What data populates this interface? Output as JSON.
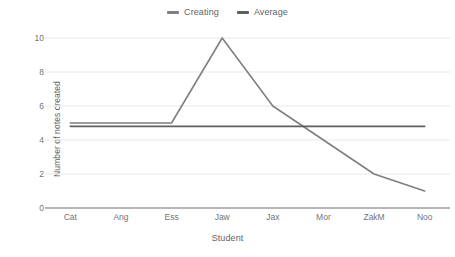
{
  "chart_data": {
    "type": "line",
    "title": "",
    "xlabel": "Student",
    "ylabel": "Number of notes created",
    "categories": [
      "Cat",
      "Ang",
      "Ess",
      "Jaw",
      "Jax",
      "Mor",
      "ZakM",
      "Noo"
    ],
    "series": [
      {
        "name": "Creating",
        "color": "#7f7f7f",
        "values": [
          5,
          5,
          5,
          10,
          6,
          4,
          2,
          1
        ]
      },
      {
        "name": "Average",
        "color": "#5f5f5f",
        "values": [
          4.8,
          4.8,
          4.8,
          4.8,
          4.8,
          4.8,
          4.8,
          4.8
        ]
      }
    ],
    "ylim": [
      0,
      10
    ],
    "yticks": [
      0,
      2,
      4,
      6,
      8,
      10
    ],
    "ytick_labels": [
      "0",
      "2",
      "4",
      "6",
      "8",
      "10"
    ],
    "grid": true,
    "grid_color": "#e8e8e8",
    "axis_color": "#9e9e9e",
    "legend_position": "top-center",
    "background": "#ffffff"
  }
}
